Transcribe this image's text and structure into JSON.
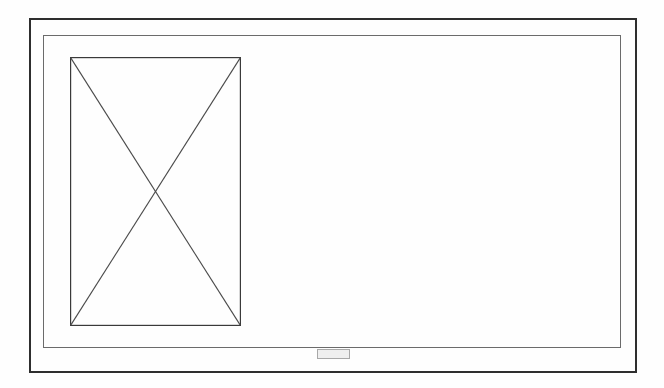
{
  "sheet": {
    "kind": "scanned-drawing-sheet",
    "background_color": "#ffffff",
    "width": 664,
    "height": 388
  },
  "outer_frame": {
    "name": "outer-border",
    "color": "#2e2e2e",
    "stroke_width": 2
  },
  "inner_frame": {
    "name": "inner-border",
    "color": "#6b6b6b",
    "stroke_width": 1
  },
  "placeholder": {
    "label": "image-placeholder",
    "description": "rectangle crossed by two diagonals",
    "rect_color": "#3a3a3a",
    "diagonal_color": "#4a4a4a",
    "x": 70,
    "y": 57,
    "width": 171,
    "height": 269
  },
  "bottom_stamp": {
    "text": "",
    "border_color": "#a8a8a8",
    "fill_color": "#efefef",
    "text_color": "#5a5a5a"
  }
}
